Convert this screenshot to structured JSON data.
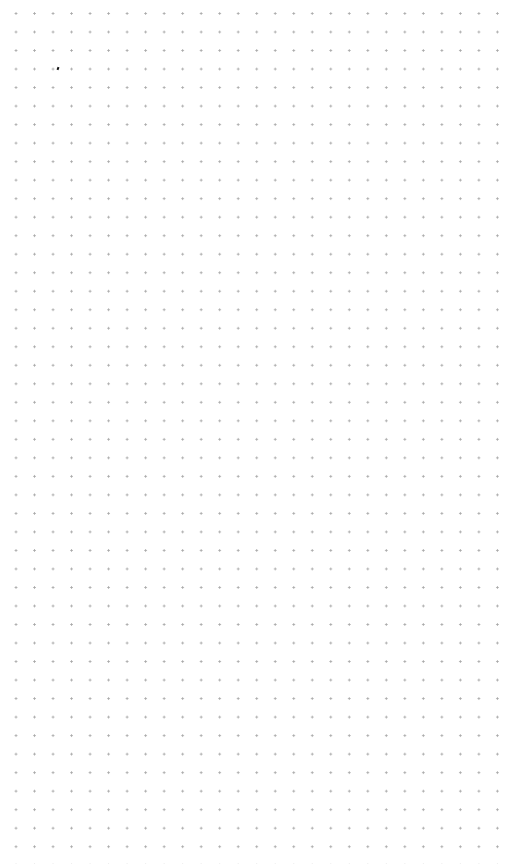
{
  "canvas": {
    "background_color": "#ffffff",
    "dot_color": "#a8a8a8",
    "grid_spacing_px": 18.5,
    "columns": 26,
    "rows": 44,
    "first_dot": {
      "x": 16,
      "y": 32
    }
  },
  "cursor_mark": {
    "color": "#111111",
    "x": 58,
    "y": 68
  }
}
